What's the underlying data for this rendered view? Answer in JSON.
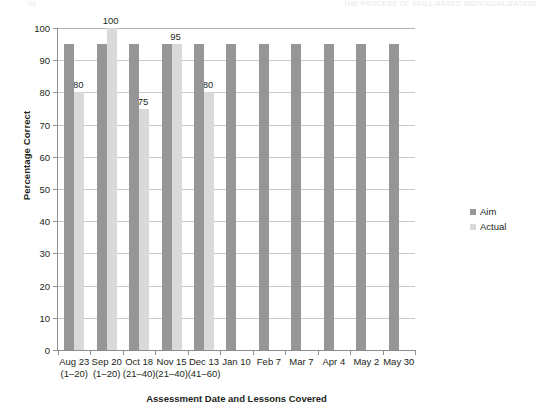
{
  "page_header": {
    "page_number": "96",
    "running_head": "THE PROCESS OF SKILL-BASED INDIVIDUALIZATION"
  },
  "legend": {
    "position": "right",
    "items": [
      {
        "label": "Aim",
        "color": "#969696"
      },
      {
        "label": "Actual",
        "color": "#d9d9d9"
      }
    ]
  },
  "chart_data": {
    "type": "bar",
    "title": "",
    "subtitle": "",
    "xlabel": "Assessment Date  and Lessons Covered",
    "ylabel": "Percentage Correct",
    "ylim": [
      0,
      100
    ],
    "ytick_step": 10,
    "yticks": [
      0,
      10,
      20,
      30,
      40,
      50,
      60,
      70,
      80,
      90,
      100
    ],
    "grid": true,
    "grid_axis": "y",
    "categories": [
      "Aug 23",
      "Sep 20",
      "Oct 18",
      "Nov 15",
      "Dec 13",
      "Jan 10",
      "Feb 7",
      "Mar 7",
      "Apr 4",
      "May 2",
      "May 30"
    ],
    "category_sublabels": [
      "(1–20)",
      "(1–20)",
      "(21–40)",
      "(21–40)",
      "(41–60)",
      "",
      "",
      "",
      "",
      "",
      ""
    ],
    "series": [
      {
        "name": "Aim",
        "color": "#969696",
        "values": [
          95,
          95,
          95,
          95,
          95,
          95,
          95,
          95,
          95,
          95,
          95
        ],
        "data_labels": [
          "",
          "",
          "",
          "",
          "",
          "",
          "",
          "",
          "",
          "",
          ""
        ]
      },
      {
        "name": "Actual",
        "color": "#d9d9d9",
        "values": [
          80,
          100,
          75,
          95,
          80,
          null,
          null,
          null,
          null,
          null,
          null
        ],
        "data_labels": [
          "80",
          "100",
          "75",
          "95",
          "80",
          "",
          "",
          "",
          "",
          "",
          ""
        ]
      }
    ]
  }
}
